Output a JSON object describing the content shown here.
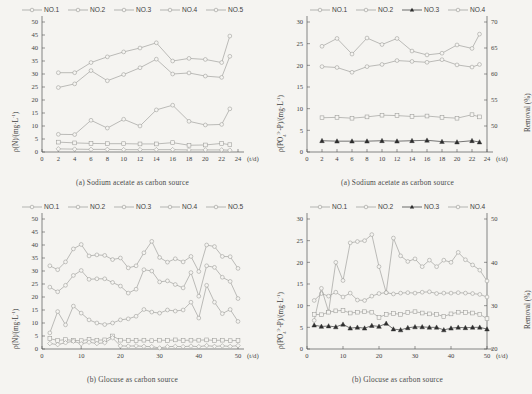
{
  "figure": {
    "background": "#f5f4f1",
    "line_color": "#9a9a97",
    "dark_marker_color": "#2e2e2e"
  },
  "panels": [
    {
      "id": "panel-a-nitrogen",
      "caption": "(a) Sodium acetate as carbon source",
      "ylabel": "ρ(N)/(mg·L⁻¹)",
      "xlabel": "(t/d)",
      "legend": [
        "NO.1",
        "NO.2",
        "NO.3",
        "NO.4",
        "NO.5"
      ],
      "chart_data": {
        "type": "line",
        "title": "(a) Sodium acetate as carbon source",
        "xlabel": "(t/d)",
        "ylabel": "ρ(N)/(mg·L⁻¹)",
        "xlim": [
          0,
          24
        ],
        "ylim": [
          0,
          50
        ],
        "xticks": [
          0,
          2,
          4,
          6,
          8,
          10,
          12,
          14,
          16,
          18,
          20,
          22,
          24
        ],
        "yticks": [
          0,
          5,
          10,
          15,
          20,
          25,
          30,
          35,
          40,
          45,
          50
        ],
        "grid": false,
        "legend_position": "top",
        "x": [
          2,
          4,
          6,
          8,
          10,
          12,
          14,
          16,
          18,
          20,
          22,
          23
        ],
        "series": [
          {
            "name": "NO.1",
            "marker": "open-circle",
            "values": [
              30.5,
              30.5,
              34.4,
              36.6,
              38.5,
              40.0,
              42.0,
              35.0,
              36.0,
              35.6,
              34.4,
              44.6
            ]
          },
          {
            "name": "NO.2",
            "marker": "open-circle",
            "values": [
              24.8,
              26.2,
              31.3,
              27.4,
              29.8,
              32.4,
              35.7,
              30.0,
              30.4,
              29.2,
              28.7,
              36.8
            ]
          },
          {
            "name": "NO.3",
            "marker": "open-circle",
            "values": [
              6.8,
              6.7,
              12.2,
              9.2,
              12.6,
              10.0,
              16.2,
              18.0,
              11.8,
              10.4,
              10.6,
              16.6
            ]
          },
          {
            "name": "NO.4",
            "marker": "open-square",
            "values": [
              3.8,
              3.5,
              3.3,
              3.2,
              3.2,
              3.1,
              3.1,
              3.6,
              2.6,
              2.7,
              3.3,
              2.8
            ]
          },
          {
            "name": "NO.5",
            "marker": "open-diamond",
            "values": [
              1.2,
              1.1,
              1.0,
              1.0,
              0.9,
              0.9,
              0.9,
              0.9,
              0.8,
              0.8,
              0.8,
              0.7
            ]
          }
        ]
      }
    },
    {
      "id": "panel-a-phosphorus",
      "caption": "(a) Sodium acetate as carbon source",
      "ylabel": "ρ(PO₄³⁻-P)/(mg·L⁻¹)",
      "ylabel_right": "Removal (%)",
      "xlabel": "(t/d)",
      "legend": [
        "NO.1",
        "NO.2",
        "NO.3",
        "NO.4"
      ],
      "chart_data": {
        "type": "line",
        "title": "(a) Sodium acetate as carbon source",
        "xlabel": "(t/d)",
        "ylabel": "ρ(PO₄³⁻-P)/(mg·L⁻¹)",
        "ylabel_right": "Removal (%)",
        "xlim": [
          0,
          24
        ],
        "ylim": [
          0,
          30
        ],
        "ylim_right": [
          45,
          70
        ],
        "xticks": [
          0,
          2,
          4,
          6,
          8,
          10,
          12,
          14,
          16,
          18,
          20,
          22,
          24
        ],
        "yticks": [
          0,
          5,
          10,
          15,
          20,
          25,
          30
        ],
        "yticks_right": [
          50,
          55,
          60,
          65,
          70
        ],
        "grid": false,
        "legend_position": "top",
        "x": [
          2,
          4,
          6,
          8,
          10,
          12,
          14,
          16,
          18,
          20,
          22,
          23
        ],
        "series": [
          {
            "name": "NO.1",
            "marker": "open-circle",
            "values": [
              24.4,
              26.2,
              22.6,
              26.3,
              24.8,
              26.2,
              23.3,
              22.4,
              22.8,
              24.7,
              23.9,
              27.2
            ]
          },
          {
            "name": "NO.2",
            "marker": "open-circle",
            "values": [
              19.7,
              19.5,
              18.4,
              19.7,
              20.2,
              21.1,
              20.9,
              20.7,
              21.3,
              20.1,
              19.6,
              20.2
            ]
          },
          {
            "name": "NO.3",
            "marker": "filled-triangle",
            "values": [
              2.6,
              2.5,
              2.5,
              2.5,
              2.6,
              2.5,
              2.6,
              2.7,
              2.4,
              2.3,
              2.6,
              2.3
            ]
          },
          {
            "name": "NO.4",
            "marker": "open-square",
            "values": [
              7.9,
              8.0,
              7.8,
              8.1,
              8.5,
              8.4,
              8.2,
              8.3,
              8.0,
              7.8,
              8.6,
              8.1
            ]
          }
        ]
      }
    },
    {
      "id": "panel-b-nitrogen",
      "caption": "(b) Glocuse as carbon source",
      "ylabel": "ρ(N)/(mg·L⁻¹)",
      "xlabel": "(t/d)",
      "legend": [
        "NO.1",
        "NO.2",
        "NO.3",
        "NO.4",
        "NO.5"
      ],
      "chart_data": {
        "type": "line",
        "title": "(b) Glocuse as carbon source",
        "xlabel": "(t/d)",
        "ylabel": "ρ(N)/(mg·L⁻¹)",
        "xlim": [
          0,
          50
        ],
        "ylim": [
          0,
          50
        ],
        "xticks": [
          0,
          10,
          20,
          30,
          40,
          50
        ],
        "yticks": [
          0,
          5,
          10,
          15,
          20,
          25,
          30,
          35,
          40,
          45,
          50
        ],
        "grid": false,
        "legend_position": "top",
        "x": [
          2,
          4,
          6,
          8,
          10,
          12,
          14,
          16,
          18,
          20,
          22,
          24,
          26,
          28,
          30,
          32,
          34,
          36,
          38,
          40,
          42,
          44,
          46,
          48,
          50
        ],
        "series": [
          {
            "name": "NO.1",
            "marker": "open-circle",
            "values": [
              32.0,
              30.5,
              33.5,
              38.5,
              40.2,
              35.8,
              36.2,
              36.0,
              34.4,
              35.0,
              31.2,
              32.0,
              37.0,
              41.4,
              35.2,
              33.4,
              34.7,
              33.5,
              35.6,
              29.8,
              40.0,
              39.4,
              35.6,
              35.5,
              31.0
            ]
          },
          {
            "name": "NO.2",
            "marker": "open-circle",
            "values": [
              23.8,
              22.0,
              24.5,
              28.3,
              30.2,
              26.8,
              27.0,
              27.0,
              25.6,
              24.2,
              21.5,
              23.0,
              30.5,
              30.0,
              25.8,
              26.2,
              24.8,
              23.5,
              29.4,
              20.3,
              32.0,
              31.4,
              27.6,
              26.0,
              19.4
            ]
          },
          {
            "name": "NO.3",
            "marker": "open-circle",
            "values": [
              6.2,
              14.4,
              9.3,
              16.5,
              13.8,
              11.2,
              10.0,
              9.4,
              10.0,
              11.2,
              11.6,
              12.6,
              15.2,
              14.2,
              13.8,
              15.0,
              14.6,
              15.0,
              18.0,
              11.9,
              24.5,
              18.0,
              13.6,
              15.2,
              10.6
            ]
          },
          {
            "name": "NO.4",
            "marker": "open-square",
            "values": [
              4.0,
              3.3,
              3.6,
              3.3,
              3.2,
              3.7,
              3.4,
              3.5,
              5.0,
              3.4,
              3.3,
              3.3,
              3.4,
              3.2,
              3.4,
              3.3,
              3.5,
              3.3,
              3.4,
              3.4,
              3.5,
              3.3,
              3.4,
              3.2,
              3.3
            ]
          },
          {
            "name": "NO.5",
            "marker": "open-diamond",
            "values": [
              2.1,
              1.7,
              2.4,
              3.0,
              2.0,
              2.6,
              2.1,
              2.4,
              4.3,
              1.2,
              1.1,
              1.2,
              1.0,
              0.9,
              0.4,
              0.9,
              1.0,
              0.9,
              1.1,
              0.9,
              1.3,
              1.0,
              1.2,
              1.0,
              1.3
            ]
          }
        ]
      }
    },
    {
      "id": "panel-b-phosphorus",
      "caption": "(b) Glocuse as carbon source",
      "ylabel": "ρ(PO₄³⁻-P)/(mg·L⁻¹)",
      "ylabel_right": "Removal (%)",
      "xlabel": "(t/d)",
      "legend": [
        "NO.1",
        "NO.2",
        "NO.3",
        "NO.4"
      ],
      "chart_data": {
        "type": "line",
        "title": "(b) Glocuse as carbon source",
        "xlabel": "(t/d)",
        "ylabel": "ρ(PO₄³⁻-P)/(mg·L⁻¹)",
        "ylabel_right": "Removal (%)",
        "xlim": [
          0,
          50
        ],
        "ylim": [
          0,
          30
        ],
        "ylim_right": [
          20,
          50
        ],
        "xticks": [
          0,
          10,
          20,
          30,
          40,
          50
        ],
        "yticks": [
          0,
          5,
          10,
          15,
          20,
          25,
          30
        ],
        "yticks_right": [
          20,
          30,
          40,
          50
        ],
        "grid": false,
        "legend_position": "top",
        "x": [
          2,
          4,
          6,
          8,
          10,
          12,
          14,
          16,
          18,
          20,
          22,
          24,
          26,
          28,
          30,
          32,
          34,
          36,
          38,
          40,
          42,
          44,
          46,
          48,
          50
        ],
        "series": [
          {
            "name": "NO.1",
            "marker": "open-circle",
            "values": [
              11.2,
              12.8,
              12.2,
              13.1,
              12.0,
              12.9,
              11.3,
              11.2,
              12.2,
              12.8,
              13.0,
              12.7,
              12.9,
              13.0,
              12.9,
              13.1,
              13.2,
              12.8,
              12.9,
              12.9,
              13.0,
              12.9,
              12.8,
              12.6,
              12.0
            ]
          },
          {
            "name": "NO.2",
            "marker": "open-circle",
            "values": [
              6.6,
              14.0,
              8.6,
              20.0,
              15.8,
              24.5,
              24.8,
              25.0,
              26.4,
              19.0,
              13.0,
              25.6,
              21.5,
              20.2,
              20.8,
              19.0,
              20.5,
              19.0,
              20.5,
              20.0,
              22.3,
              20.6,
              19.4,
              18.2,
              15.7
            ]
          },
          {
            "name": "NO.3",
            "marker": "filled-triangle",
            "values": [
              5.5,
              5.2,
              5.3,
              5.1,
              5.7,
              4.8,
              5.0,
              4.8,
              5.4,
              5.2,
              5.9,
              4.6,
              4.4,
              4.9,
              5.1,
              5.1,
              5.0,
              5.0,
              4.4,
              4.8,
              5.0,
              4.9,
              5.0,
              5.0,
              4.6
            ]
          },
          {
            "name": "NO.4",
            "marker": "open-square",
            "values": [
              8.0,
              7.9,
              8.5,
              8.8,
              8.9,
              8.3,
              8.5,
              8.6,
              8.5,
              7.3,
              8.0,
              8.2,
              8.0,
              8.4,
              8.6,
              8.3,
              8.1,
              8.0,
              7.5,
              8.1,
              8.5,
              8.4,
              8.3,
              8.0,
              7.0
            ]
          }
        ]
      }
    }
  ]
}
